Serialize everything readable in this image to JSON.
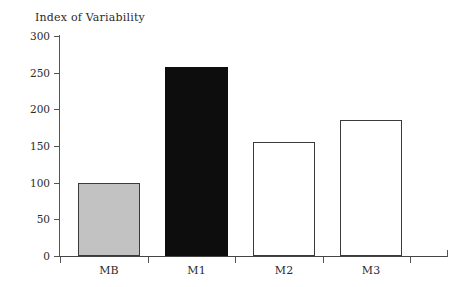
{
  "chart_data": {
    "type": "bar",
    "title": "Index of Variability",
    "xlabel": "",
    "ylabel": "",
    "categories": [
      "MB",
      "M1",
      "M2",
      "M3"
    ],
    "values": [
      100,
      258,
      155,
      185
    ],
    "series": [
      {
        "name": "Index of Variability",
        "values": [
          100,
          258,
          155,
          185
        ]
      }
    ],
    "bar_styles": [
      {
        "category": "MB",
        "fill": "#c2c2c2",
        "stroke": "#3a3a3a"
      },
      {
        "category": "M1",
        "fill": "#0d0d0d",
        "stroke": "#0d0d0d"
      },
      {
        "category": "M2",
        "fill": "#ffffff",
        "stroke": "#3a3a3a"
      },
      {
        "category": "M3",
        "fill": "#ffffff",
        "stroke": "#3a3a3a"
      }
    ],
    "ylim": [
      0,
      300
    ],
    "ytick_labels": [
      "0",
      "50",
      "100",
      "150",
      "200",
      "250",
      "300"
    ],
    "ytick_values": [
      0,
      50,
      100,
      150,
      200,
      250,
      300
    ],
    "grid": false,
    "legend": "none",
    "axis_color": "#555555",
    "text_color": "#2b2b2b",
    "background": "#ffffff"
  }
}
